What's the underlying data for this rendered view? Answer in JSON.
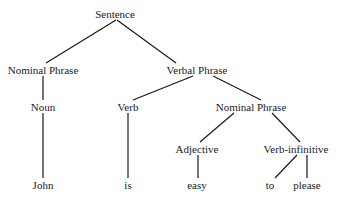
{
  "diagram": {
    "type": "syntax-tree",
    "line_color": "#1a1a1a",
    "nodes": [
      {
        "id": "sentence",
        "label": "Sentence",
        "x": 115,
        "y": 14
      },
      {
        "id": "np1",
        "label": "Nominal Phrase",
        "x": 43,
        "y": 70
      },
      {
        "id": "vp",
        "label": "Verbal Phrase",
        "x": 197,
        "y": 70
      },
      {
        "id": "noun",
        "label": "Noun",
        "x": 43,
        "y": 107
      },
      {
        "id": "verb",
        "label": "Verb",
        "x": 128,
        "y": 107
      },
      {
        "id": "np2",
        "label": "Nominal Phrase",
        "x": 251,
        "y": 107
      },
      {
        "id": "adj",
        "label": "Adjective",
        "x": 197,
        "y": 149
      },
      {
        "id": "vinf",
        "label": "Verb-infinitive",
        "x": 296,
        "y": 149
      },
      {
        "id": "john",
        "label": "John",
        "x": 43,
        "y": 185
      },
      {
        "id": "is",
        "label": "is",
        "x": 128,
        "y": 185
      },
      {
        "id": "easy",
        "label": "easy",
        "x": 197,
        "y": 185
      },
      {
        "id": "to",
        "label": "to",
        "x": 270,
        "y": 185
      },
      {
        "id": "please",
        "label": "please",
        "x": 307,
        "y": 185
      }
    ],
    "edges": [
      {
        "from": "sentence",
        "to": "np1",
        "x1": 116,
        "y1": 20,
        "x2": 46,
        "y2": 63
      },
      {
        "from": "sentence",
        "to": "vp",
        "x1": 117,
        "y1": 20,
        "x2": 176,
        "y2": 63
      },
      {
        "from": "np1",
        "to": "noun",
        "x1": 43,
        "y1": 76,
        "x2": 43,
        "y2": 100
      },
      {
        "from": "vp",
        "to": "verb",
        "x1": 193,
        "y1": 76,
        "x2": 133,
        "y2": 100
      },
      {
        "from": "vp",
        "to": "np2",
        "x1": 213,
        "y1": 76,
        "x2": 261,
        "y2": 100
      },
      {
        "from": "noun",
        "to": "john",
        "x1": 43,
        "y1": 113,
        "x2": 43,
        "y2": 178
      },
      {
        "from": "verb",
        "to": "is",
        "x1": 128,
        "y1": 113,
        "x2": 128,
        "y2": 178
      },
      {
        "from": "np2",
        "to": "adj",
        "x1": 234,
        "y1": 113,
        "x2": 200,
        "y2": 142
      },
      {
        "from": "np2",
        "to": "vinf",
        "x1": 272,
        "y1": 113,
        "x2": 300,
        "y2": 142
      },
      {
        "from": "adj",
        "to": "easy",
        "x1": 198,
        "y1": 155,
        "x2": 198,
        "y2": 178
      },
      {
        "from": "vinf",
        "to": "to",
        "x1": 297,
        "y1": 155,
        "x2": 275,
        "y2": 178
      },
      {
        "from": "vinf",
        "to": "please",
        "x1": 307,
        "y1": 155,
        "x2": 307,
        "y2": 178
      }
    ]
  }
}
